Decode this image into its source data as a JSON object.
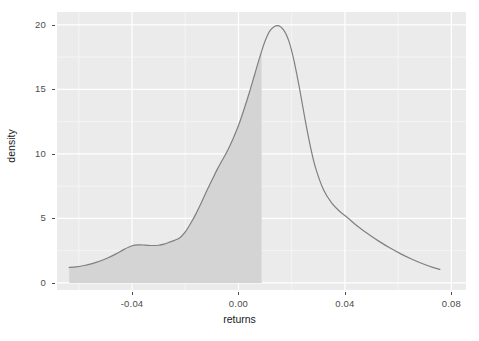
{
  "chart_data": {
    "type": "area",
    "title": "",
    "subtitle": "",
    "xlabel": "returns",
    "ylabel": "density",
    "xlim": [
      -0.0682,
      0.0855
    ],
    "ylim": [
      -0.55,
      21.0
    ],
    "xticks": [
      -0.04,
      0.0,
      0.04,
      0.08
    ],
    "xticklabels": [
      "-0.04",
      "0.00",
      "0.04",
      "0.08"
    ],
    "yticks": [
      0,
      5,
      10,
      15,
      20
    ],
    "yticklabels": [
      "0",
      "5",
      "10",
      "15",
      "20"
    ],
    "grid": true,
    "grid_major_color": "#ffffff",
    "grid_minor_color": "#f5f5f5",
    "panel_background": "#ebebeb",
    "legend": null,
    "legend_position": "none",
    "series": [
      {
        "name": "density",
        "type": "line",
        "line_color": "#808080",
        "line_width": 1.2,
        "x": [
          -0.0636,
          -0.061,
          -0.058,
          -0.055,
          -0.052,
          -0.049,
          -0.046,
          -0.043,
          -0.04,
          -0.0375,
          -0.035,
          -0.0325,
          -0.03,
          -0.028,
          -0.026,
          -0.024,
          -0.022,
          -0.02,
          -0.018,
          -0.016,
          -0.014,
          -0.012,
          -0.01,
          -0.008,
          -0.006,
          -0.004,
          -0.002,
          0.0,
          0.002,
          0.004,
          0.006,
          0.008,
          0.01,
          0.012,
          0.0147,
          0.017,
          0.019,
          0.021,
          0.023,
          0.025,
          0.027,
          0.029,
          0.032,
          0.035,
          0.038,
          0.041,
          0.045,
          0.049,
          0.053,
          0.057,
          0.061,
          0.065,
          0.069,
          0.073,
          0.0757
        ],
        "y": [
          1.2,
          1.25,
          1.35,
          1.5,
          1.7,
          1.95,
          2.25,
          2.6,
          2.88,
          2.95,
          2.93,
          2.9,
          2.92,
          3.0,
          3.15,
          3.3,
          3.5,
          3.95,
          4.6,
          5.35,
          6.2,
          7.1,
          7.95,
          8.8,
          9.55,
          10.3,
          11.2,
          12.2,
          13.4,
          14.7,
          16.1,
          17.5,
          18.75,
          19.6,
          19.95,
          19.6,
          18.7,
          17.1,
          15.0,
          12.7,
          10.6,
          8.9,
          7.2,
          6.2,
          5.55,
          5.05,
          4.35,
          3.75,
          3.2,
          2.7,
          2.25,
          1.85,
          1.5,
          1.2,
          1.05
        ]
      }
    ],
    "shaded_region": {
      "name": "shaded-area-under-curve",
      "fill_color": "#d4d4d4",
      "x_from": -0.0636,
      "x_to": 0.0087,
      "y_base": 0,
      "description": "grey filled area under the density curve from the left tail up to approximately 0.0087"
    },
    "annotations": []
  },
  "axes": {
    "x_title": "returns",
    "y_title": "density"
  }
}
